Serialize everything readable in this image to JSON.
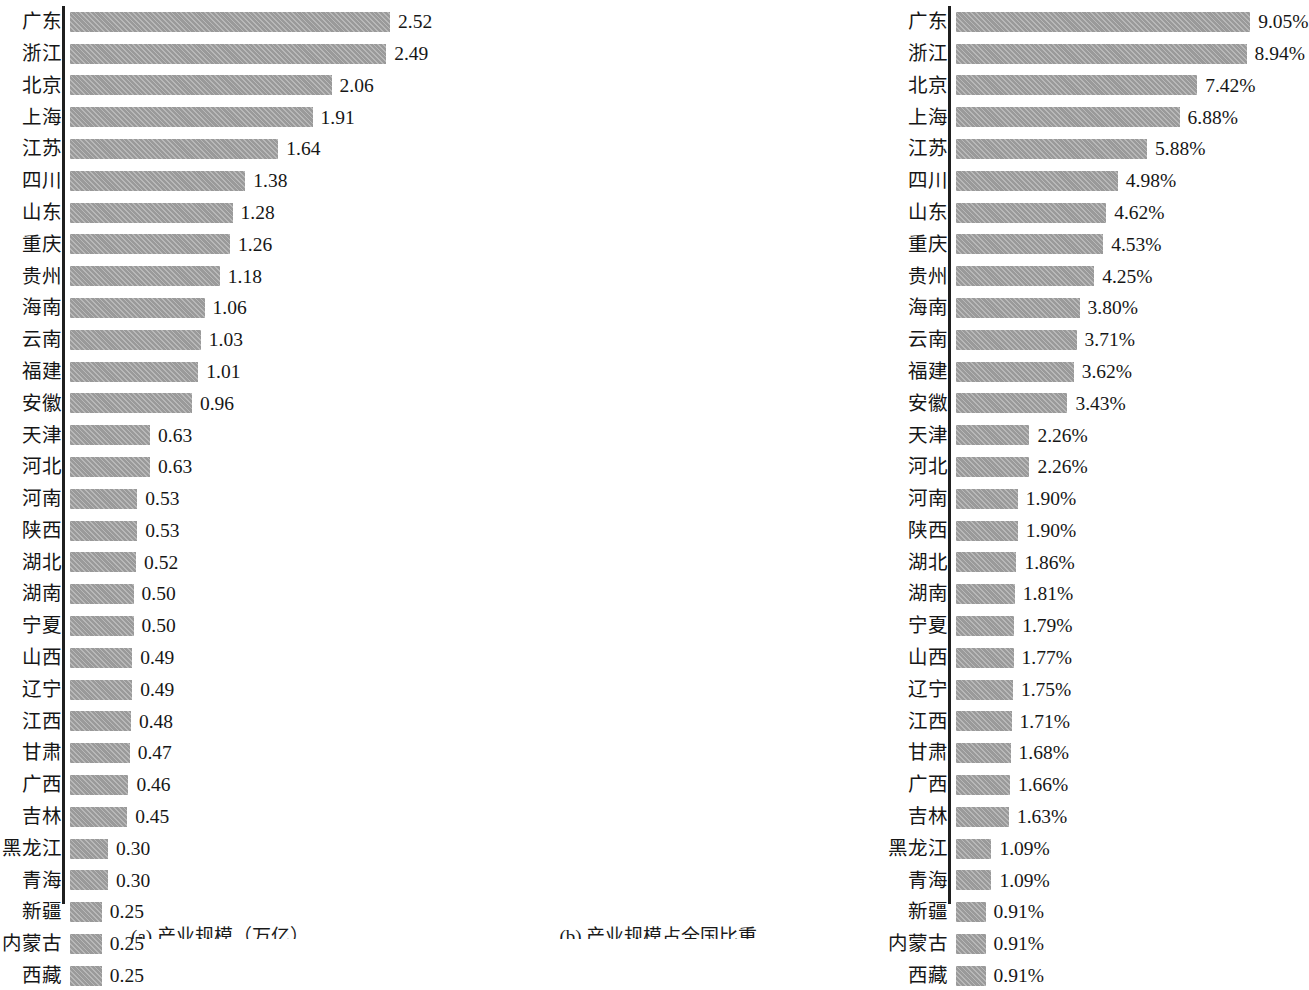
{
  "figure": {
    "panels": [
      {
        "id": "panel-a",
        "caption": "(a) 产业规模（万亿）",
        "axis_max": 2.52,
        "unit": ""
      },
      {
        "id": "panel-b",
        "caption": "(b) 产业规模占全国比重",
        "axis_max": 9.05,
        "unit": "%"
      }
    ]
  },
  "chart_data": [
    {
      "type": "bar",
      "orientation": "horizontal",
      "title": "(a) 产业规模（万亿）",
      "xlabel": "产业规模（万亿）",
      "ylabel": "",
      "xlim": [
        0,
        2.52
      ],
      "grid": false,
      "legend": "none",
      "sorted": "descending",
      "categories": [
        "广东",
        "浙江",
        "北京",
        "上海",
        "江苏",
        "四川",
        "山东",
        "重庆",
        "贵州",
        "海南",
        "云南",
        "福建",
        "安徽",
        "天津",
        "河北",
        "河南",
        "陕西",
        "湖北",
        "湖南",
        "宁夏",
        "山西",
        "辽宁",
        "江西",
        "甘肃",
        "广西",
        "吉林",
        "黑龙江",
        "青海",
        "新疆",
        "内蒙古",
        "西藏"
      ],
      "values": [
        2.52,
        2.49,
        2.06,
        1.91,
        1.64,
        1.38,
        1.28,
        1.26,
        1.18,
        1.06,
        1.03,
        1.01,
        0.96,
        0.63,
        0.63,
        0.53,
        0.53,
        0.52,
        0.5,
        0.5,
        0.49,
        0.49,
        0.48,
        0.47,
        0.46,
        0.45,
        0.3,
        0.3,
        0.25,
        0.25,
        0.25
      ],
      "labels": [
        "2.52",
        "2.49",
        "2.06",
        "1.91",
        "1.64",
        "1.38",
        "1.28",
        "1.26",
        "1.18",
        "1.06",
        "1.03",
        "1.01",
        "0.96",
        "0.63",
        "0.63",
        "0.53",
        "0.53",
        "0.52",
        "0.50",
        "0.50",
        "0.49",
        "0.49",
        "0.48",
        "0.47",
        "0.46",
        "0.45",
        "0.30",
        "0.30",
        "0.25",
        "0.25",
        "0.25"
      ]
    },
    {
      "type": "bar",
      "orientation": "horizontal",
      "title": "(b) 产业规模占全国比重",
      "xlabel": "产业规模占全国比重",
      "ylabel": "",
      "xlim": [
        0,
        9.05
      ],
      "grid": false,
      "legend": "none",
      "sorted": "descending",
      "categories": [
        "广东",
        "浙江",
        "北京",
        "上海",
        "江苏",
        "四川",
        "山东",
        "重庆",
        "贵州",
        "海南",
        "云南",
        "福建",
        "安徽",
        "天津",
        "河北",
        "河南",
        "陕西",
        "湖北",
        "湖南",
        "宁夏",
        "山西",
        "辽宁",
        "江西",
        "甘肃",
        "广西",
        "吉林",
        "黑龙江",
        "青海",
        "新疆",
        "内蒙古",
        "西藏"
      ],
      "values": [
        9.05,
        8.94,
        7.42,
        6.88,
        5.88,
        4.98,
        4.62,
        4.53,
        4.25,
        3.8,
        3.71,
        3.62,
        3.43,
        2.26,
        2.26,
        1.9,
        1.9,
        1.86,
        1.81,
        1.79,
        1.77,
        1.75,
        1.71,
        1.68,
        1.66,
        1.63,
        1.09,
        1.09,
        0.91,
        0.91,
        0.91
      ],
      "labels": [
        "9.05%",
        "8.94%",
        "7.42%",
        "6.88%",
        "5.88%",
        "4.98%",
        "4.62%",
        "4.53%",
        "4.25%",
        "3.80%",
        "3.71%",
        "3.62%",
        "3.43%",
        "2.26%",
        "2.26%",
        "1.90%",
        "1.90%",
        "1.86%",
        "1.81%",
        "1.79%",
        "1.77%",
        "1.75%",
        "1.71%",
        "1.68%",
        "1.66%",
        "1.63%",
        "1.09%",
        "1.09%",
        "0.91%",
        "0.91%",
        "0.91%"
      ]
    }
  ],
  "style": {
    "bar_color": "#9a9a9a",
    "axis_color": "#1f1f1f",
    "text_color": "#161616",
    "background": "#ffffff"
  }
}
